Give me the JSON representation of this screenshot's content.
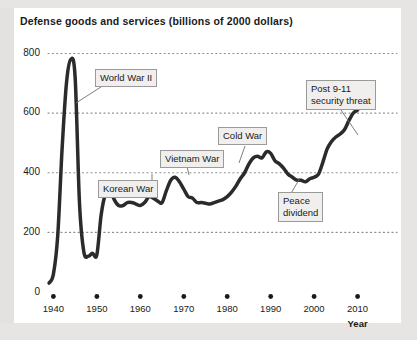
{
  "chart_data": {
    "type": "line",
    "title": "Defense goods and services (billions of 2000 dollars)",
    "xlabel": "Year",
    "ylabel": "",
    "xlim": [
      1938,
      2011
    ],
    "ylim": [
      0,
      800
    ],
    "grid": "dotted-horizontal",
    "legend": "none",
    "series": [
      {
        "name": "Defense goods and services",
        "color": "#2b2b2b",
        "x": [
          1939,
          1940,
          1941,
          1942,
          1943,
          1944,
          1945,
          1946,
          1947,
          1948,
          1949,
          1950,
          1951,
          1952,
          1953,
          1954,
          1955,
          1956,
          1957,
          1958,
          1959,
          1960,
          1961,
          1962,
          1963,
          1964,
          1965,
          1966,
          1967,
          1968,
          1969,
          1970,
          1971,
          1972,
          1973,
          1974,
          1975,
          1976,
          1977,
          1978,
          1979,
          1980,
          1981,
          1982,
          1983,
          1984,
          1985,
          1986,
          1987,
          1988,
          1989,
          1990,
          1991,
          1992,
          1993,
          1994,
          1995,
          1996,
          1997,
          1998,
          1999,
          2000,
          2001,
          2002,
          2003,
          2004,
          2005,
          2006,
          2007,
          2008,
          2009,
          2010
        ],
        "y": [
          30,
          60,
          190,
          480,
          700,
          780,
          720,
          300,
          135,
          120,
          130,
          125,
          260,
          330,
          345,
          310,
          290,
          290,
          300,
          300,
          295,
          290,
          300,
          320,
          315,
          305,
          300,
          340,
          375,
          385,
          370,
          345,
          320,
          315,
          300,
          300,
          298,
          295,
          300,
          305,
          310,
          320,
          335,
          355,
          380,
          400,
          430,
          450,
          455,
          450,
          470,
          465,
          440,
          430,
          415,
          395,
          385,
          375,
          375,
          370,
          380,
          385,
          395,
          435,
          480,
          505,
          520,
          530,
          545,
          575,
          600,
          610
        ]
      }
    ],
    "yticks": [
      0,
      200,
      400,
      600,
      800
    ],
    "xticks": [
      1940,
      1950,
      1960,
      1970,
      1980,
      1990,
      2000,
      2010
    ],
    "annotations": [
      {
        "id": "world-war-ii",
        "lines": [
          "World War II"
        ]
      },
      {
        "id": "korean-war",
        "lines": [
          "Korean War"
        ]
      },
      {
        "id": "vietnam-war",
        "lines": [
          "Vietnam War"
        ]
      },
      {
        "id": "cold-war",
        "lines": [
          "Cold War"
        ]
      },
      {
        "id": "peace-dividend",
        "lines": [
          "Peace",
          "dividend"
        ]
      },
      {
        "id": "post-911-security-threat",
        "lines": [
          "Post 9-11",
          "security threat"
        ]
      }
    ]
  },
  "axes": {
    "y_labels": [
      "800",
      "600",
      "400",
      "200",
      "0"
    ],
    "x_labels": [
      "1940",
      "1950",
      "1960",
      "1970",
      "1980",
      "1990",
      "2000",
      "2010"
    ],
    "x_title": "Year"
  },
  "annotations": {
    "world_war_ii": "World War II",
    "korean_war": "Korean War",
    "vietnam_war": "Vietnam War",
    "cold_war": "Cold War",
    "peace_dividend_line1": "Peace",
    "peace_dividend_line2": "dividend",
    "post_911_line1": "Post 9-11",
    "post_911_line2": "security threat"
  },
  "colors": {
    "line": "#2b2b2b",
    "background": "#e6e5e3",
    "panel": "#ffffff",
    "gridline": "#8e8e8c",
    "annotation_fill": "#f0efed",
    "annotation_border": "#9a9a98"
  }
}
